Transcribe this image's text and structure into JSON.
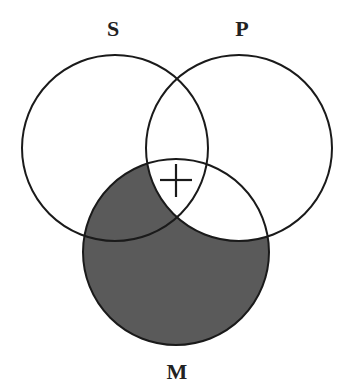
{
  "diagram": {
    "type": "venn",
    "labels": {
      "s": "S",
      "p": "P",
      "m": "M"
    },
    "mark": "+",
    "colors": {
      "stroke": "#1a1a1a",
      "shade": "#5a5a5a",
      "background": "#ffffff"
    },
    "shaded_region": "M outside P",
    "marked_region": "S ∩ P ∩ M"
  }
}
